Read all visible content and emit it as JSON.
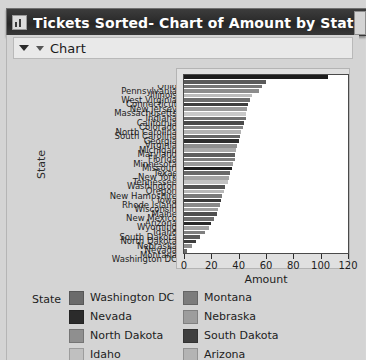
{
  "window": {
    "title": "Tickets Sorted- Chart of Amount by State",
    "icon": "chart-document-icon"
  },
  "panel": {
    "title": "Chart",
    "collapse_icon": "triangle-down-icon",
    "menu_icon": "triangle-down-small-icon"
  },
  "chart_data": {
    "type": "bar",
    "orientation": "horizontal",
    "title": "Chart of Amount by State",
    "xlabel": "Amount",
    "ylabel": "State",
    "xlim": [
      0,
      120
    ],
    "xticks": [
      0,
      20,
      40,
      60,
      80,
      100,
      120
    ],
    "grid": false,
    "legend_position": "bottom",
    "legend_title": "State",
    "categories": [
      "Ohio",
      "Pennsylvania",
      "Illinois",
      "West Virginia",
      "Connecticut",
      "New Jersey",
      "Massachusetts",
      "Indiana",
      "California",
      "Colorado",
      "North Carolina",
      "South Carolina",
      "Georgia",
      "Virginia",
      "Michigan",
      "Maryland",
      "Florida",
      "Minnesota",
      "Missouri",
      "Texas",
      "New York",
      "Tennessee",
      "Washington",
      "Oregon",
      "New Hampshire",
      "Iowa",
      "Rhode Island",
      "Wisconsin",
      "Maine",
      "New Mexico",
      "Arizona",
      "Wyoming",
      "Idaho",
      "South Dakota",
      "North Dakota",
      "Nebraska",
      "Nevada",
      "Montana",
      "Washington DC"
    ],
    "values": [
      105,
      60,
      57,
      55,
      50,
      48,
      47,
      46,
      45,
      45,
      44,
      43,
      42,
      41,
      40,
      39,
      38,
      37,
      37,
      36,
      35,
      34,
      33,
      32,
      30,
      29,
      28,
      27,
      26,
      25,
      24,
      22,
      20,
      18,
      15,
      12,
      9,
      6,
      2
    ],
    "bar_colors": [
      "#1c1c1c",
      "#5a5a5a",
      "#777777",
      "#8c8c8c",
      "#bcbcbc",
      "#6e6e6e",
      "#3f3f3f",
      "#9a9a9a",
      "#c8c8c8",
      "#707070",
      "#4a4a4a",
      "#858585",
      "#b2b2b2",
      "#666666",
      "#2e2e2e",
      "#8f8f8f",
      "#aaaaaa",
      "#5f5f5f",
      "#7d7d7d",
      "#999999",
      "#1f1f1f",
      "#6a6a6a",
      "#a4a4a4",
      "#c2c2c2",
      "#555555",
      "#b8b8b8",
      "#7a7a7a",
      "#3a3a3a",
      "#8a8a8a",
      "#9e9e9e",
      "#4f4f4f",
      "#6d6d6d",
      "#2a2a2a",
      "#a0a0a0",
      "#7f7f7f",
      "#5c5c5c",
      "#3c3c3c",
      "#8d8d8d",
      "#6b6b6b"
    ]
  },
  "legend": {
    "title": "State",
    "columns": [
      {
        "items": [
          {
            "label": "Washington DC",
            "color": "#6b6b6b"
          },
          {
            "label": "Nevada",
            "color": "#2b2b2b"
          },
          {
            "label": "North Dakota",
            "color": "#8f8f8f"
          },
          {
            "label": "Idaho",
            "color": "#c0c0c0"
          }
        ]
      },
      {
        "items": [
          {
            "label": "Montana",
            "color": "#7c7c7c"
          },
          {
            "label": "Nebraska",
            "color": "#9d9d9d"
          },
          {
            "label": "South Dakota",
            "color": "#3f3f3f"
          },
          {
            "label": "Arizona",
            "color": "#b4b4b4"
          }
        ]
      }
    ]
  }
}
